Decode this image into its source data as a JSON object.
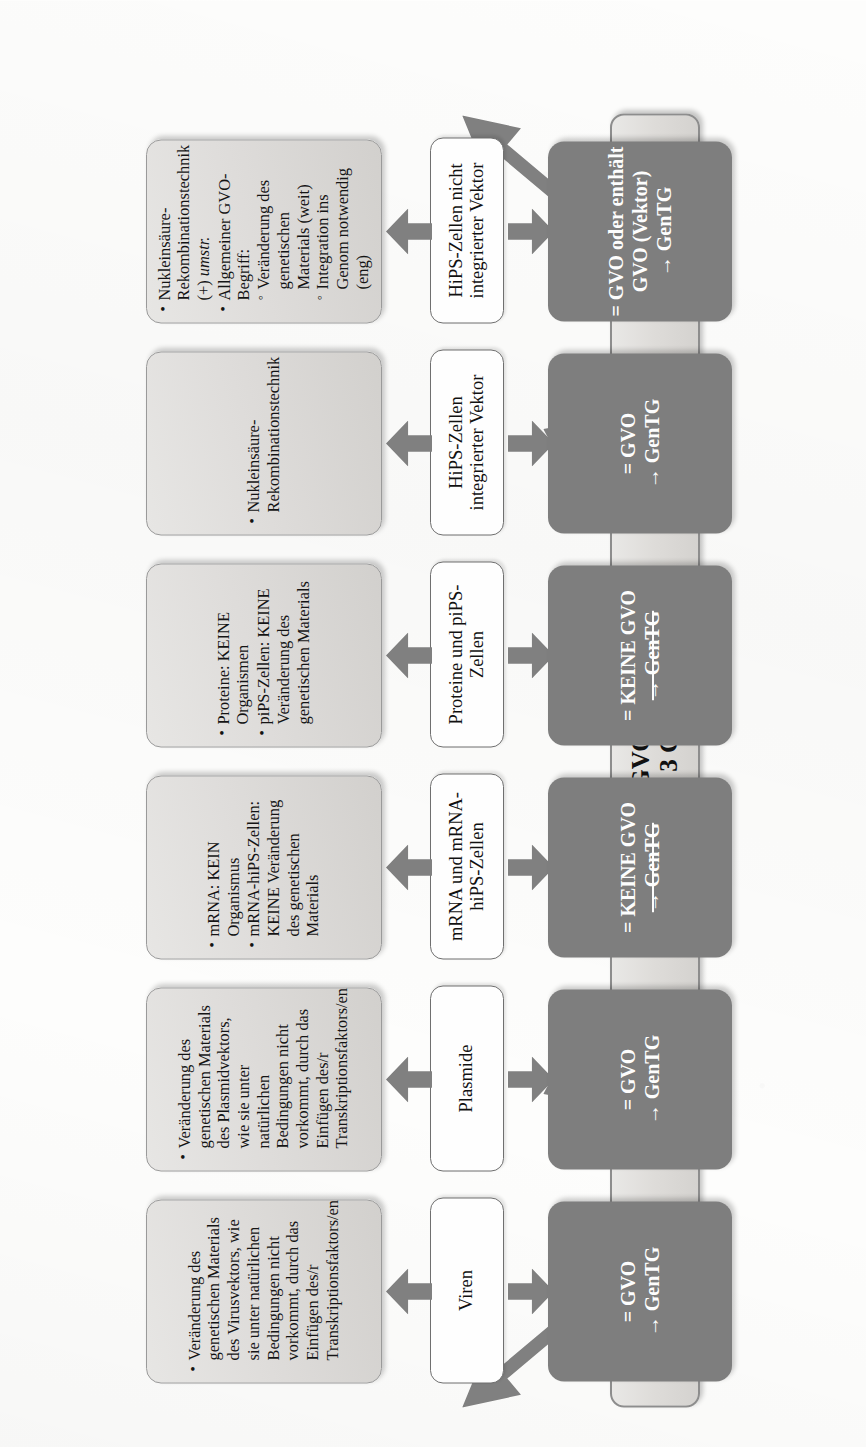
{
  "diagram": {
    "title_visible": false,
    "root": {
      "line1": "GVO",
      "line2": "(§ 3 Nr. 3 GenTG)"
    },
    "colors": {
      "result_box": "#7e7e7e",
      "detail_box": "#dedcda",
      "arrow": "#808080",
      "border": "#8d8d8d"
    },
    "branches": [
      {
        "id": "viren",
        "category": "Viren",
        "details": [
          {
            "text": "Veränderung des genetischen Materials des Virusvektors, wie sie unter natürlichen Bedingungen nicht vorkommt, durch das Einfügen des/r Transkriptionsfaktors/en",
            "sub": []
          }
        ],
        "result": {
          "line1": "= GVO",
          "line2": "→ GenTG",
          "line2_struck": false
        }
      },
      {
        "id": "plasmide",
        "category": "Plasmide",
        "details": [
          {
            "text": "Veränderung des genetischen Materials des Plasmidvektors, wie sie unter natürlichen Bedingungen nicht vorkommt, durch das Einfügen des/r Transkriptionsfaktors/en",
            "sub": []
          }
        ],
        "result": {
          "line1": "= GVO",
          "line2": "→ GenTG",
          "line2_struck": false
        }
      },
      {
        "id": "mrna",
        "category": "mRNA und mRNA-hiPS-Zellen",
        "details": [
          {
            "text": "mRNA: KEIN Organismus",
            "sub": []
          },
          {
            "text": "mRNA-hiPS-Zellen: KEINE Veränderung des genetischen Materials",
            "sub": []
          }
        ],
        "result": {
          "line1": "= KEINE GVO",
          "line2": "→ GenTG",
          "line2_struck": true
        }
      },
      {
        "id": "proteine-pips",
        "category": "Proteine und piPS-Zellen",
        "details": [
          {
            "text": "Proteine: KEINE Organismen",
            "sub": []
          },
          {
            "text": "piPS-Zellen: KEINE Veränderung des genetischen Materials",
            "sub": []
          }
        ],
        "result": {
          "line1": "= KEINE GVO",
          "line2": "→ GenTG",
          "line2_struck": true
        }
      },
      {
        "id": "hips-integriert",
        "category": "HiPS-Zellen integrierter Vektor",
        "details": [
          {
            "text": "Nukleinsäure-Rekombinationstechnik",
            "sub": []
          }
        ],
        "result": {
          "line1": "= GVO",
          "line2": "→ GenTG",
          "line2_struck": false
        }
      },
      {
        "id": "hips-nicht-integriert",
        "category": "HiPS-Zellen nicht integrierter Vektor",
        "details": [
          {
            "text": "Nukleinsäure-Rekombinationstechnik (+) umstr.",
            "italic_tail": "umstr.",
            "sub": []
          },
          {
            "text": "Allgemeiner GVO-Begriff:",
            "sub": [
              "Veränderung des genetischen Materials (weit)",
              "Integration ins Genom notwendig (eng)"
            ]
          }
        ],
        "result": {
          "line1": "= GVO oder enthält GVO (Vektor)",
          "line2": "→ GenTG",
          "line2_struck": false
        }
      }
    ]
  }
}
